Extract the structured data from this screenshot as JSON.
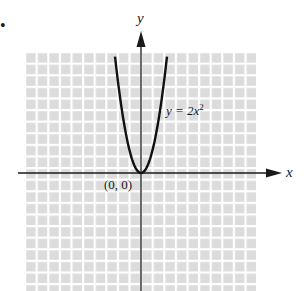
{
  "bullet": "•",
  "chart_data": {
    "type": "line",
    "title": "",
    "xlabel": "x",
    "ylabel": "y",
    "xlim": [
      -10,
      10
    ],
    "ylim": [
      -10.2,
      10.4
    ],
    "grid": true,
    "legend": "none",
    "series": [
      {
        "name": "y = 2x^2",
        "function": "2*x^2",
        "x": [
          -2.24,
          -2,
          -1.5,
          -1,
          -0.5,
          0,
          0.5,
          1,
          1.5,
          2,
          2.24
        ],
        "y": [
          10.0,
          8,
          4.5,
          2,
          0.5,
          0,
          0.5,
          2,
          4.5,
          8,
          10.0
        ]
      }
    ],
    "annotations": [
      {
        "text": "(0, 0)",
        "x": 0,
        "y": 0
      },
      {
        "text": "y = 2x²",
        "x": 2.2,
        "y": 5.8
      }
    ]
  },
  "labels": {
    "x_axis": "x",
    "y_axis": "y",
    "origin": "(0, 0)",
    "equation_prefix": "y = 2x",
    "equation_exp": "2"
  }
}
